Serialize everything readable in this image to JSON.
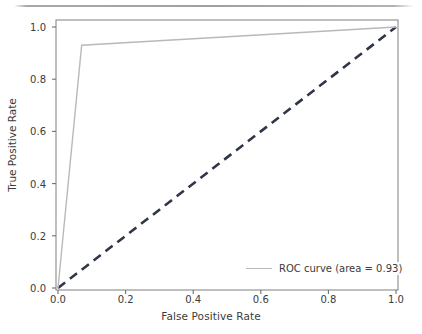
{
  "figure": {
    "background_color": "#ffffff",
    "artifact_color": "#8f8f8f"
  },
  "chart_data": {
    "type": "line",
    "title": "",
    "xlabel": "False Positive Rate",
    "ylabel": "True Positive Rate",
    "xlim": [
      0.0,
      1.0
    ],
    "ylim": [
      0.0,
      1.0
    ],
    "grid": false,
    "legend_position": "lower right",
    "xticks": [
      0.0,
      0.2,
      0.4,
      0.6,
      0.8,
      1.0
    ],
    "xtick_labels": [
      "0.0",
      "0.2",
      "0.4",
      "0.6",
      "0.8",
      "1.0"
    ],
    "yticks": [
      0.0,
      0.2,
      0.4,
      0.6,
      0.8,
      1.0
    ],
    "ytick_labels": [
      "0.0",
      "0.2",
      "0.4",
      "0.6",
      "0.8",
      "1.0"
    ],
    "series": [
      {
        "name": "ROC curve (area = 0.93)",
        "legend_label": "ROC curve (area = 0.93)",
        "color": "#b9b9b9",
        "linestyle": "solid",
        "linewidth": 1.4,
        "auc": 0.93,
        "x": [
          0.0,
          0.07,
          1.0
        ],
        "y": [
          0.0,
          0.93,
          1.0
        ]
      },
      {
        "name": "chance diagonal",
        "legend_label": "",
        "color": "#2f3646",
        "linestyle": "dashed",
        "linewidth": 2.6,
        "x": [
          0.0,
          1.0
        ],
        "y": [
          0.0,
          1.0
        ]
      }
    ]
  },
  "axes": {
    "spine_color": "#8b8b8b",
    "tick_color": "#6f6f6f",
    "text_color": "#3b3b3b"
  },
  "legend": {
    "label": "ROC curve (area = 0.93)",
    "frame": false
  }
}
